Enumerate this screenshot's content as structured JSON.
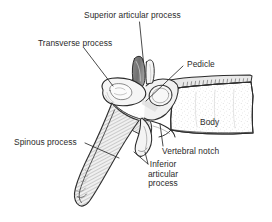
{
  "figure": {
    "name": "lumbar-vertebra-lateral-view",
    "background_color": "#ffffff",
    "ink_color": "#2b2b2b",
    "shade_color": "#9a9a9a"
  },
  "labels": {
    "superior_articular_process": "Superior articular process",
    "transverse_process": "Transverse process",
    "pedicle": "Pedicle",
    "body": "Body",
    "spinous_process": "Spinous process",
    "vertebral_notch": "Vertebral notch",
    "inferior_articular_process_l1": "Inferior",
    "inferior_articular_process_l2": "articular",
    "inferior_articular_process_l3": "process"
  }
}
